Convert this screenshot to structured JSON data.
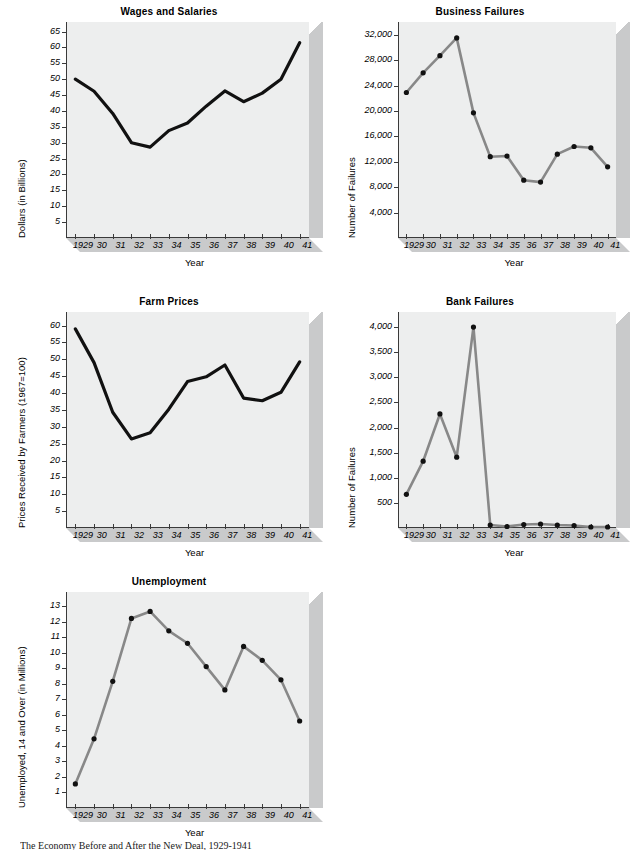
{
  "figure": {
    "caption": "The Economy Before and After the New Deal, 1929-1941",
    "panel_face_color": "#edeeee",
    "depth_color": "#c9cacb",
    "axis_color": "#3a3a3a",
    "dark_line_color": "#111111",
    "gray_line_color": "#888888",
    "marker_color": "#111111"
  },
  "charts": [
    {
      "id": "wages-and-salaries",
      "chart_data": {
        "type": "line",
        "title": "Wages and Salaries",
        "xlabel": "Year",
        "ylabel": "Dollars (in Billions)",
        "categories": [
          "1929",
          "30",
          "31",
          "32",
          "33",
          "34",
          "35",
          "36",
          "37",
          "38",
          "39",
          "40",
          "41"
        ],
        "x_tick_labels": [
          "1929",
          "30",
          "31",
          "32",
          "33",
          "34",
          "35",
          "36",
          "37",
          "38",
          "39",
          "40",
          "41"
        ],
        "y_tick_labels": [
          "5",
          "10",
          "15",
          "20",
          "25",
          "30",
          "35",
          "40",
          "45",
          "50",
          "55",
          "60",
          "65"
        ],
        "y_ticks": [
          5,
          10,
          15,
          20,
          25,
          30,
          35,
          40,
          45,
          50,
          55,
          60,
          65
        ],
        "ylim": [
          0,
          68
        ],
        "values": [
          50.0,
          46.2,
          39.2,
          30.0,
          28.6,
          33.8,
          36.2,
          41.5,
          46.3,
          42.9,
          45.6,
          50.0,
          61.5
        ],
        "series_style": "dark-thick-no-marker",
        "grid": false,
        "legend": "none"
      }
    },
    {
      "id": "business-failures",
      "chart_data": {
        "type": "line",
        "title": "Business Failures",
        "xlabel": "Year",
        "ylabel": "Number of Failures",
        "categories": [
          "1929",
          "30",
          "31",
          "32",
          "33",
          "34",
          "35",
          "36",
          "37",
          "38",
          "39",
          "40",
          "41"
        ],
        "x_tick_labels": [
          "1929",
          "30",
          "31",
          "32",
          "33",
          "34",
          "35",
          "36",
          "37",
          "38",
          "39",
          "40",
          "41"
        ],
        "y_tick_labels": [
          "4,000",
          "8,000",
          "12,000",
          "16,000",
          "20,000",
          "24,000",
          "28,000",
          "32,000"
        ],
        "y_ticks": [
          4000,
          8000,
          12000,
          16000,
          20000,
          24000,
          28000,
          32000
        ],
        "ylim": [
          0,
          34000
        ],
        "values": [
          22900,
          26000,
          28700,
          31500,
          19700,
          12800,
          12900,
          9100,
          8800,
          13200,
          14400,
          14200,
          11200
        ],
        "series_style": "gray-line-with-dots",
        "grid": false,
        "legend": "none"
      }
    },
    {
      "id": "farm-prices",
      "chart_data": {
        "type": "line",
        "title": "Farm Prices",
        "xlabel": "Year",
        "ylabel": "Prices Received by Farmers (1967=100)",
        "categories": [
          "1929",
          "30",
          "31",
          "32",
          "33",
          "34",
          "35",
          "36",
          "37",
          "38",
          "39",
          "40",
          "41"
        ],
        "x_tick_labels": [
          "1929",
          "30",
          "31",
          "32",
          "33",
          "34",
          "35",
          "36",
          "37",
          "38",
          "39",
          "40",
          "41"
        ],
        "y_tick_labels": [
          "5",
          "10",
          "15",
          "20",
          "25",
          "30",
          "35",
          "40",
          "45",
          "50",
          "55",
          "60"
        ],
        "y_ticks": [
          5,
          10,
          15,
          20,
          25,
          30,
          35,
          40,
          45,
          50,
          55,
          60
        ],
        "ylim": [
          0,
          64
        ],
        "values": [
          59.0,
          49.0,
          34.3,
          26.4,
          28.2,
          35.2,
          43.4,
          44.8,
          48.3,
          38.5,
          37.7,
          40.2,
          49.2
        ],
        "series_style": "dark-thick-no-marker",
        "grid": false,
        "legend": "none"
      }
    },
    {
      "id": "bank-failures",
      "chart_data": {
        "type": "line",
        "title": "Bank Failures",
        "xlabel": "Year",
        "ylabel": "Number of Failures",
        "categories": [
          "1929",
          "30",
          "31",
          "32",
          "33",
          "34",
          "35",
          "36",
          "37",
          "38",
          "39",
          "40",
          "41"
        ],
        "x_tick_labels": [
          "1929",
          "30",
          "31",
          "32",
          "33",
          "34",
          "35",
          "36",
          "37",
          "38",
          "39",
          "40",
          "41"
        ],
        "y_tick_labels": [
          "500",
          "1,000",
          "1,500",
          "2,000",
          "2,500",
          "3,000",
          "3,500",
          "4,000"
        ],
        "y_ticks": [
          500,
          1000,
          1500,
          2000,
          2500,
          3000,
          3500,
          4000
        ],
        "ylim": [
          0,
          4300
        ],
        "values": [
          670,
          1330,
          2270,
          1410,
          4000,
          60,
          30,
          70,
          80,
          60,
          50,
          20,
          20
        ],
        "series_style": "gray-line-with-dots",
        "grid": false,
        "legend": "none"
      }
    },
    {
      "id": "unemployment",
      "chart_data": {
        "type": "line",
        "title": "Unemployment",
        "xlabel": "Year",
        "ylabel": "Unemployed, 14 and Over (in Millions)",
        "categories": [
          "1929",
          "30",
          "31",
          "32",
          "33",
          "34",
          "35",
          "36",
          "37",
          "38",
          "39",
          "40",
          "41"
        ],
        "x_tick_labels": [
          "1929",
          "30",
          "31",
          "32",
          "33",
          "34",
          "35",
          "36",
          "37",
          "38",
          "39",
          "40",
          "41"
        ],
        "y_tick_labels": [
          "1",
          "2",
          "3",
          "4",
          "5",
          "6",
          "7",
          "8",
          "9",
          "10",
          "11",
          "12",
          "13"
        ],
        "y_ticks": [
          1,
          2,
          3,
          4,
          5,
          6,
          7,
          8,
          9,
          10,
          11,
          12,
          13
        ],
        "ylim": [
          0,
          13.9
        ],
        "values": [
          1.55,
          4.45,
          8.15,
          12.2,
          12.65,
          11.4,
          10.6,
          9.1,
          7.6,
          10.4,
          9.5,
          8.25,
          5.6
        ],
        "series_style": "gray-line-with-dots",
        "grid": false,
        "legend": "none"
      }
    }
  ]
}
